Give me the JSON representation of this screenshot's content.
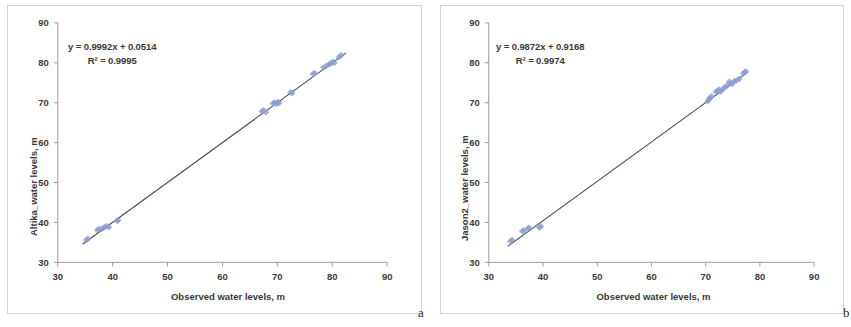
{
  "figure": {
    "background_color": "#ffffff",
    "panel_border_color": "#d2d2d2",
    "marker_color": "#8b9dd4",
    "trendline_color": "#4a4a4a",
    "axis_color": "#9a9a9a",
    "text_color": "#3a3a3a",
    "caption_a": "a",
    "caption_b": "b"
  },
  "chart_data": [
    {
      "type": "scatter",
      "panel": "a",
      "title": "",
      "xlabel": "Observed water levels, m",
      "ylabel": "Altika_water levels, m",
      "xlim": [
        30,
        90
      ],
      "ylim": [
        30,
        90
      ],
      "xticks": [
        30,
        40,
        50,
        60,
        70,
        80,
        90
      ],
      "yticks": [
        30,
        40,
        50,
        60,
        70,
        80,
        90
      ],
      "xtick_labels": [
        "30",
        "40",
        "50",
        "60",
        "70",
        "80",
        "90"
      ],
      "ytick_labels": [
        "30",
        "40",
        "50",
        "60",
        "70",
        "80",
        "90"
      ],
      "grid": false,
      "legend": "none",
      "annotations": {
        "equation": "y = 0.9992x + 0.0514",
        "r_squared": "R² = 0.9995"
      },
      "fit": {
        "slope": 0.9992,
        "intercept": 0.0514,
        "r2": 0.9995
      },
      "trendline_x": [
        34.5,
        82.5
      ],
      "points": [
        {
          "x": 35.2,
          "y": 35.6
        },
        {
          "x": 35.5,
          "y": 35.9
        },
        {
          "x": 37.2,
          "y": 38.1
        },
        {
          "x": 37.6,
          "y": 38.4
        },
        {
          "x": 38.2,
          "y": 38.6
        },
        {
          "x": 38.6,
          "y": 38.9
        },
        {
          "x": 39.0,
          "y": 39.1
        },
        {
          "x": 39.3,
          "y": 38.8
        },
        {
          "x": 40.8,
          "y": 40.4
        },
        {
          "x": 41.0,
          "y": 40.6
        },
        {
          "x": 67.2,
          "y": 67.8
        },
        {
          "x": 67.5,
          "y": 68.1
        },
        {
          "x": 67.9,
          "y": 67.6
        },
        {
          "x": 69.2,
          "y": 69.8
        },
        {
          "x": 69.5,
          "y": 70.0
        },
        {
          "x": 69.8,
          "y": 69.7
        },
        {
          "x": 70.1,
          "y": 70.2
        },
        {
          "x": 70.3,
          "y": 69.9
        },
        {
          "x": 72.4,
          "y": 72.6
        },
        {
          "x": 72.7,
          "y": 72.4
        },
        {
          "x": 76.5,
          "y": 77.2
        },
        {
          "x": 76.8,
          "y": 77.4
        },
        {
          "x": 78.4,
          "y": 78.8
        },
        {
          "x": 78.9,
          "y": 79.2
        },
        {
          "x": 79.4,
          "y": 79.6
        },
        {
          "x": 79.8,
          "y": 79.9
        },
        {
          "x": 80.1,
          "y": 80.2
        },
        {
          "x": 80.4,
          "y": 80.0
        },
        {
          "x": 81.2,
          "y": 81.4
        },
        {
          "x": 81.6,
          "y": 81.9
        }
      ]
    },
    {
      "type": "scatter",
      "panel": "b",
      "title": "",
      "xlabel": "Observed water levels, m",
      "ylabel": "Jason2_water levels, m",
      "xlim": [
        30,
        90
      ],
      "ylim": [
        30,
        90
      ],
      "xticks": [
        30,
        40,
        50,
        60,
        70,
        80,
        90
      ],
      "yticks": [
        30,
        40,
        50,
        60,
        70,
        80,
        90
      ],
      "xtick_labels": [
        "30",
        "40",
        "50",
        "60",
        "70",
        "80",
        "90"
      ],
      "ytick_labels": [
        "30",
        "40",
        "50",
        "60",
        "70",
        "80",
        "90"
      ],
      "grid": false,
      "legend": "none",
      "annotations": {
        "equation": "y = 0.9872x + 0.9168",
        "r_squared": "R² = 0.9974"
      },
      "fit": {
        "slope": 0.9872,
        "intercept": 0.9168,
        "r2": 0.9974
      },
      "trendline_x": [
        33.5,
        77.8
      ],
      "points": [
        {
          "x": 34.0,
          "y": 35.3
        },
        {
          "x": 34.3,
          "y": 35.6
        },
        {
          "x": 36.2,
          "y": 37.8
        },
        {
          "x": 36.5,
          "y": 38.0
        },
        {
          "x": 37.2,
          "y": 38.4
        },
        {
          "x": 37.4,
          "y": 38.7
        },
        {
          "x": 39.3,
          "y": 38.7
        },
        {
          "x": 39.6,
          "y": 39.0
        },
        {
          "x": 70.4,
          "y": 70.4
        },
        {
          "x": 70.6,
          "y": 70.8
        },
        {
          "x": 70.8,
          "y": 71.3
        },
        {
          "x": 71.1,
          "y": 71.6
        },
        {
          "x": 71.9,
          "y": 72.7
        },
        {
          "x": 72.2,
          "y": 73.0
        },
        {
          "x": 72.5,
          "y": 73.3
        },
        {
          "x": 72.8,
          "y": 72.8
        },
        {
          "x": 73.3,
          "y": 73.6
        },
        {
          "x": 73.6,
          "y": 73.9
        },
        {
          "x": 74.0,
          "y": 74.4
        },
        {
          "x": 74.3,
          "y": 75.2
        },
        {
          "x": 74.6,
          "y": 75.0
        },
        {
          "x": 74.9,
          "y": 74.7
        },
        {
          "x": 75.3,
          "y": 75.4
        },
        {
          "x": 75.7,
          "y": 75.6
        },
        {
          "x": 76.2,
          "y": 76.0
        },
        {
          "x": 76.9,
          "y": 77.3
        },
        {
          "x": 77.2,
          "y": 77.6
        },
        {
          "x": 77.4,
          "y": 77.8
        }
      ]
    }
  ]
}
